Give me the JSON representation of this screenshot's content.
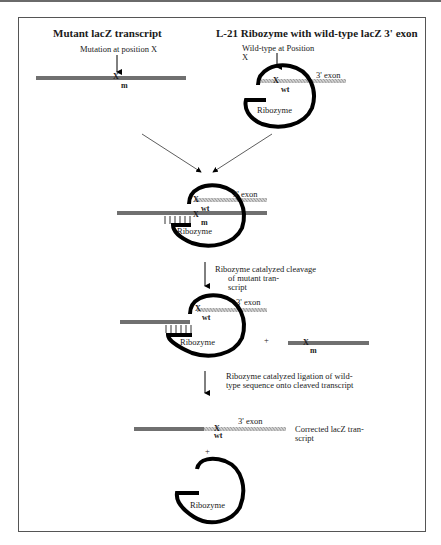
{
  "figure": {
    "left_title": "Mutant lacZ transcript",
    "right_title": "L-21 Ribozyme with wild-type lacZ 3' exon",
    "mutation_label": "Mutation at position X",
    "wildtype_label_1": "Wild-type at Position",
    "wildtype_label_2": "X",
    "exon_label": "3' exon",
    "ribozyme_label": "Ribozyme",
    "site_x": "X",
    "mutant_mark": "m",
    "wildtype_mark": "wt",
    "plus": "+",
    "step1_lines": [
      "Ribozyme catalyzed cleavage",
      "of mutant tran-",
      "script"
    ],
    "step2_lines": [
      "Ribozyme catalyzed ligation of wild-",
      "type sequence onto cleaved transcript"
    ],
    "result_lines": [
      "Corrected lacZ tran-",
      "script"
    ]
  },
  "colors": {
    "mutant_strand": "#7a7a7a",
    "exon_strand": "#bdbdbd",
    "ribozyme": "#000000",
    "frame": "#555555"
  }
}
